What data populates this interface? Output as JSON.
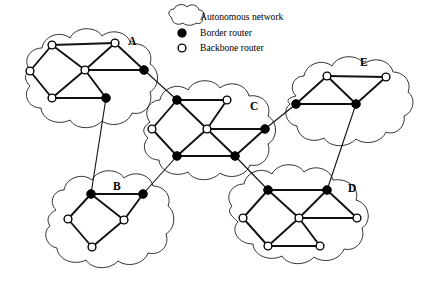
{
  "figure": {
    "background": "#ffffff",
    "line_color": "#111111",
    "node_fill_border": "#000000",
    "node_fill_backbone": "#ffffff"
  },
  "legend": {
    "items": [
      {
        "symbol": "cloud-icon",
        "label": "Autonomous network"
      },
      {
        "symbol": "filled-circle-icon",
        "label": "Border router"
      },
      {
        "symbol": "open-circle-icon",
        "label": "Backbone router"
      }
    ]
  },
  "clouds": [
    {
      "id": "A",
      "label": "A",
      "label_pos": {
        "x": 128,
        "y": 45
      },
      "outline": "M 30,70 C 22,60 30,48 42,48 C 44,36 60,30 70,38 C 76,26 96,26 102,36 C 112,28 128,32 131,44 C 144,42 154,52 150,64 C 160,70 160,86 150,92 C 154,104 144,116 132,113 C 128,124 112,128 102,121 C 94,130 76,130 70,120 C 58,126 42,120 41,108 C 28,108 22,94 30,86 C 24,80 24,74 30,70 Z",
      "nodes": [
        {
          "id": "A1",
          "type": "backbone",
          "x": 52,
          "y": 45
        },
        {
          "id": "A2",
          "type": "backbone",
          "x": 115,
          "y": 43
        },
        {
          "id": "A3",
          "type": "backbone",
          "x": 30,
          "y": 71
        },
        {
          "id": "A4",
          "type": "backbone",
          "x": 85,
          "y": 70
        },
        {
          "id": "A5",
          "type": "border",
          "x": 144,
          "y": 70
        },
        {
          "id": "A6",
          "type": "backbone",
          "x": 52,
          "y": 98
        },
        {
          "id": "A7",
          "type": "border",
          "x": 106,
          "y": 98
        }
      ],
      "edges": [
        [
          "A1",
          "A2"
        ],
        [
          "A1",
          "A3"
        ],
        [
          "A1",
          "A4"
        ],
        [
          "A2",
          "A4"
        ],
        [
          "A2",
          "A5"
        ],
        [
          "A3",
          "A6"
        ],
        [
          "A4",
          "A6"
        ],
        [
          "A4",
          "A5"
        ],
        [
          "A4",
          "A7"
        ],
        [
          "A6",
          "A7"
        ]
      ]
    },
    {
      "id": "C",
      "label": "C",
      "label_pos": {
        "x": 250,
        "y": 110
      },
      "outline": "M 150,122 C 142,112 150,100 160,100 C 162,88 178,82 188,90 C 194,78 214,78 220,88 C 230,80 246,84 249,96 C 262,94 272,104 268,116 C 278,122 278,138 268,144 C 272,156 262,168 250,165 C 246,176 230,180 220,173 C 212,182 194,182 188,172 C 176,178 160,172 159,160 C 146,160 140,146 148,138 C 142,132 142,128 150,122 Z",
      "nodes": [
        {
          "id": "C1",
          "type": "border",
          "x": 177,
          "y": 100
        },
        {
          "id": "C2",
          "type": "backbone",
          "x": 227,
          "y": 100
        },
        {
          "id": "C3",
          "type": "backbone",
          "x": 152,
          "y": 129
        },
        {
          "id": "C4",
          "type": "backbone",
          "x": 207,
          "y": 129
        },
        {
          "id": "C5",
          "type": "border",
          "x": 265,
          "y": 129
        },
        {
          "id": "C6",
          "type": "border",
          "x": 177,
          "y": 156
        },
        {
          "id": "C7",
          "type": "border",
          "x": 235,
          "y": 156
        }
      ],
      "edges": [
        [
          "C1",
          "C2"
        ],
        [
          "C1",
          "C3"
        ],
        [
          "C1",
          "C4"
        ],
        [
          "C2",
          "C4"
        ],
        [
          "C3",
          "C6"
        ],
        [
          "C4",
          "C6"
        ],
        [
          "C4",
          "C5"
        ],
        [
          "C4",
          "C7"
        ],
        [
          "C5",
          "C7"
        ],
        [
          "C6",
          "C7"
        ]
      ]
    },
    {
      "id": "E",
      "label": "E",
      "label_pos": {
        "x": 360,
        "y": 66
      },
      "outline": "M 296,96 C 288,88 294,76 304,76 C 306,64 322,58 332,66 C 338,54 358,54 364,64 C 374,56 390,60 393,72 C 404,72 412,82 408,92 C 416,98 414,112 404,116 C 406,126 396,136 386,132 C 382,142 366,146 356,139 C 348,148 330,148 324,138 C 312,144 298,138 297,126 C 286,124 282,110 290,104 C 286,100 288,98 296,96 Z",
      "nodes": [
        {
          "id": "E1",
          "type": "backbone",
          "x": 327,
          "y": 76
        },
        {
          "id": "E2",
          "type": "backbone",
          "x": 386,
          "y": 77
        },
        {
          "id": "E3",
          "type": "border",
          "x": 296,
          "y": 104
        },
        {
          "id": "E4",
          "type": "border",
          "x": 356,
          "y": 104
        }
      ],
      "edges": [
        [
          "E1",
          "E2"
        ],
        [
          "E1",
          "E3"
        ],
        [
          "E1",
          "E4"
        ],
        [
          "E2",
          "E4"
        ],
        [
          "E3",
          "E4"
        ]
      ]
    },
    {
      "id": "B",
      "label": "B",
      "label_pos": {
        "x": 113,
        "y": 190
      },
      "outline": "M 56,210 C 48,202 54,190 64,190 C 66,178 82,172 92,180 C 98,168 118,168 124,178 C 134,170 150,174 153,186 C 164,186 172,196 168,206 C 176,212 176,228 166,234 C 170,246 160,256 148,253 C 144,264 128,268 118,261 C 110,270 92,270 86,260 C 74,266 58,260 57,248 C 46,246 42,232 50,226 C 46,220 48,214 56,210 Z",
      "nodes": [
        {
          "id": "B1",
          "type": "border",
          "x": 91,
          "y": 194
        },
        {
          "id": "B2",
          "type": "border",
          "x": 143,
          "y": 194
        },
        {
          "id": "B3",
          "type": "backbone",
          "x": 68,
          "y": 219
        },
        {
          "id": "B4",
          "type": "backbone",
          "x": 124,
          "y": 220
        },
        {
          "id": "B5",
          "type": "backbone",
          "x": 92,
          "y": 247
        }
      ],
      "edges": [
        [
          "B1",
          "B2"
        ],
        [
          "B1",
          "B3"
        ],
        [
          "B1",
          "B4"
        ],
        [
          "B2",
          "B4"
        ],
        [
          "B3",
          "B5"
        ],
        [
          "B4",
          "B5"
        ]
      ]
    },
    {
      "id": "D",
      "label": "D",
      "label_pos": {
        "x": 348,
        "y": 192
      },
      "outline": "M 232,206 C 224,196 232,184 244,184 C 246,172 262,166 272,174 C 278,162 298,162 304,172 C 314,164 330,168 333,180 C 348,178 360,188 356,200 C 370,204 372,222 362,228 C 366,240 356,252 344,249 C 340,260 324,264 314,257 C 306,266 288,266 282,256 C 270,262 254,256 253,244 C 238,244 230,230 238,222 C 232,216 226,212 232,206 Z",
      "nodes": [
        {
          "id": "D1",
          "type": "border",
          "x": 268,
          "y": 190
        },
        {
          "id": "D2",
          "type": "border",
          "x": 327,
          "y": 190
        },
        {
          "id": "D3",
          "type": "backbone",
          "x": 243,
          "y": 218
        },
        {
          "id": "D4",
          "type": "backbone",
          "x": 299,
          "y": 218
        },
        {
          "id": "D5",
          "type": "backbone",
          "x": 357,
          "y": 218
        },
        {
          "id": "D6",
          "type": "backbone",
          "x": 268,
          "y": 246
        },
        {
          "id": "D7",
          "type": "backbone",
          "x": 320,
          "y": 246
        }
      ],
      "edges": [
        [
          "D1",
          "D2"
        ],
        [
          "D1",
          "D3"
        ],
        [
          "D1",
          "D4"
        ],
        [
          "D2",
          "D4"
        ],
        [
          "D2",
          "D5"
        ],
        [
          "D3",
          "D6"
        ],
        [
          "D4",
          "D6"
        ],
        [
          "D4",
          "D5"
        ],
        [
          "D4",
          "D7"
        ],
        [
          "D6",
          "D7"
        ]
      ]
    }
  ],
  "inter_cloud_links": [
    {
      "from": "A5",
      "to": "C1",
      "from_cloud": "A",
      "to_cloud": "C"
    },
    {
      "from": "A7",
      "to": "B1",
      "from_cloud": "A",
      "to_cloud": "B"
    },
    {
      "from": "C6",
      "to": "B2",
      "from_cloud": "C",
      "to_cloud": "B"
    },
    {
      "from": "C5",
      "to": "E3",
      "from_cloud": "C",
      "to_cloud": "E"
    },
    {
      "from": "C7",
      "to": "D1",
      "from_cloud": "C",
      "to_cloud": "D"
    },
    {
      "from": "E4",
      "to": "D2",
      "from_cloud": "E",
      "to_cloud": "D"
    }
  ],
  "legend_layout": {
    "cloud_icon": {
      "x": 180,
      "y": 16
    },
    "border_icon": {
      "x": 182,
      "y": 31
    },
    "backbone_icon": {
      "x": 182,
      "y": 46
    },
    "text_x": 200,
    "rows_y": [
      19,
      34,
      49
    ]
  }
}
